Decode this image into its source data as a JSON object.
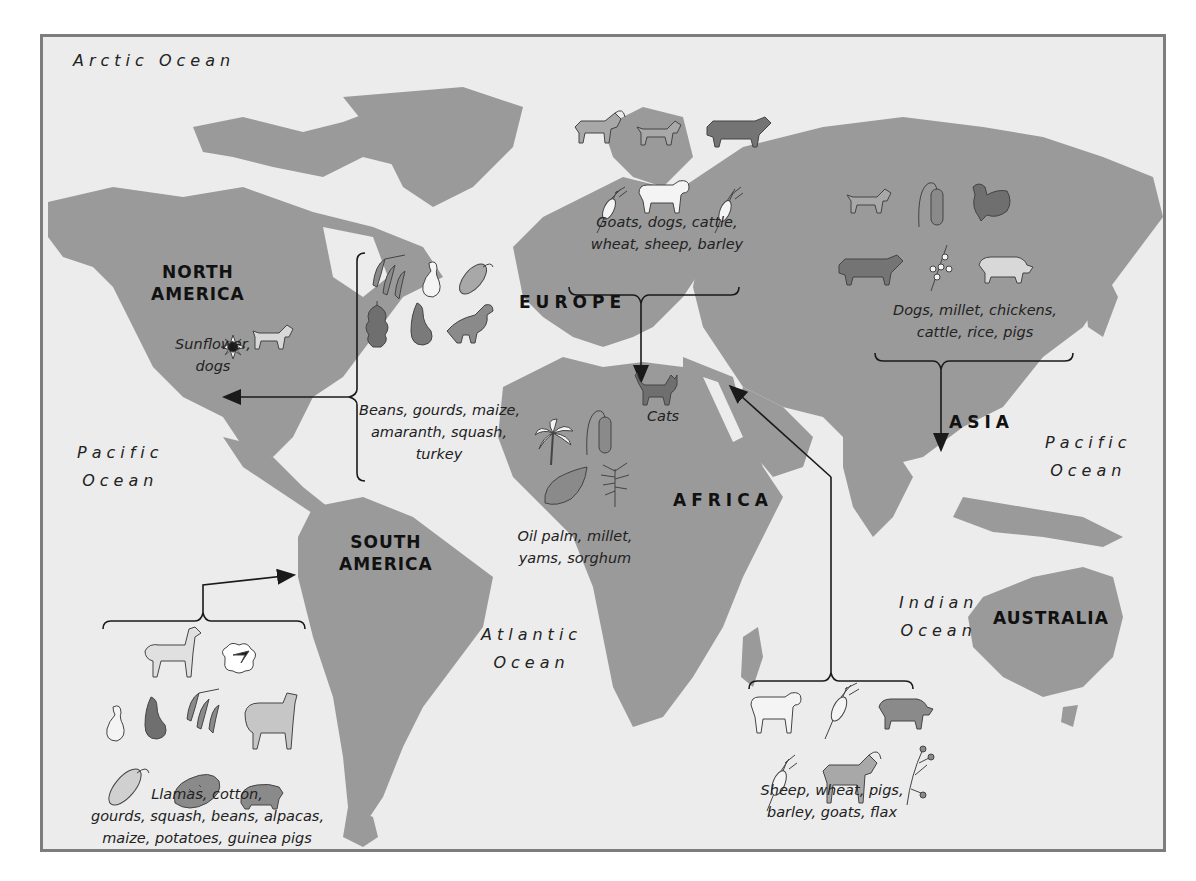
{
  "oceans": {
    "arctic": "Arctic Ocean",
    "pacific_west": {
      "line1": "Pacific",
      "line2": "Ocean"
    },
    "pacific_east": {
      "line1": "Pacific",
      "line2": "Ocean"
    },
    "atlantic": {
      "line1": "Atlantic",
      "line2": "Ocean"
    },
    "indian": {
      "line1": "Indian",
      "line2": "Ocean"
    }
  },
  "continents": {
    "north_america": {
      "line1": "NORTH",
      "line2": "AMERICA"
    },
    "south_america": {
      "line1": "SOUTH",
      "line2": "AMERICA"
    },
    "europe": "EUROPE",
    "asia": "ASIA",
    "africa": "AFRICA",
    "australia": "AUSTRALIA"
  },
  "domestication_groups": {
    "north_america": {
      "lines": [
        "Sunflower,",
        "dogs"
      ],
      "icons": [
        "sunflower-icon",
        "dog-icon"
      ]
    },
    "mesoamerica": {
      "lines": [
        "Beans, gourds, maize,",
        "amaranth, squash,",
        "turkey"
      ],
      "icons": [
        "beans-icon",
        "gourd-icon",
        "maize-icon",
        "amaranth-icon",
        "squash-icon",
        "turkey-icon"
      ]
    },
    "south_america": {
      "lines": [
        "Llamas, cotton,",
        "gourds, squash, beans, alpacas,",
        "maize, potatoes, guinea pigs"
      ],
      "icons": [
        "llama-icon",
        "cotton-icon",
        "gourd-icon",
        "squash-icon",
        "beans-icon",
        "alpaca-icon",
        "maize-icon",
        "potato-icon",
        "guinea-pig-icon"
      ]
    },
    "europe": {
      "lines": [
        "Goats, dogs, cattle,",
        "wheat, sheep, barley"
      ],
      "icons": [
        "goat-icon",
        "dog-icon",
        "cattle-icon",
        "wheat-icon",
        "sheep-icon",
        "barley-icon"
      ]
    },
    "asia": {
      "lines": [
        "Dogs, millet, chickens,",
        "cattle, rice, pigs"
      ],
      "icons": [
        "dog-icon",
        "millet-icon",
        "chicken-icon",
        "cattle-icon",
        "rice-icon",
        "pig-icon"
      ]
    },
    "egypt": {
      "lines": [
        "Cats"
      ],
      "icons": [
        "cat-icon"
      ]
    },
    "africa": {
      "lines": [
        "Oil palm, millet,",
        "yams, sorghum"
      ],
      "icons": [
        "oil-palm-icon",
        "millet-icon",
        "yam-icon",
        "sorghum-icon"
      ]
    },
    "fertile_crescent": {
      "lines": [
        "Sheep, wheat, pigs,",
        "barley, goats, flax"
      ],
      "icons": [
        "sheep-icon",
        "wheat-icon",
        "pig-icon",
        "barley-icon",
        "goat-icon",
        "flax-icon"
      ]
    }
  },
  "colors": {
    "land": "#9a9a9a",
    "water": "#ececec",
    "border": "#7d7d7d",
    "text": "#1a1a1a",
    "icon_mid": "#8a8a8a",
    "icon_dark": "#6f6f6f",
    "icon_light": "#f4f4f4"
  }
}
